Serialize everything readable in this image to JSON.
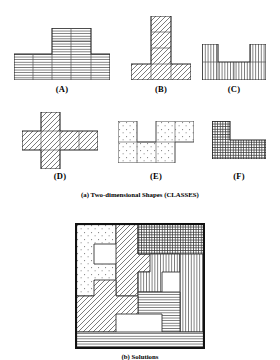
{
  "figure": {
    "panel_a": {
      "caption": "(a) Two-dimensional Shapes (CLASSES)",
      "shapes": [
        {
          "label": "(A)",
          "name": "shape-a",
          "fill": "horizontal-lines",
          "cells": [
            [
              0,
              1
            ],
            [
              1,
              1
            ],
            [
              2,
              1
            ],
            [
              3,
              1
            ],
            [
              4,
              1
            ],
            [
              3,
              0
            ],
            [
              2,
              0
            ]
          ],
          "grid_w": 5,
          "grid_h": 2,
          "note": "5-wide base row with a 2-cell step up on the left of column 4"
        },
        {
          "label": "(B)",
          "name": "shape-b",
          "fill": "diagonal-hatch",
          "cells": [
            [
              0,
              3
            ],
            [
              1,
              3
            ],
            [
              2,
              3
            ],
            [
              1,
              0
            ],
            [
              1,
              1
            ],
            [
              1,
              2
            ]
          ],
          "grid_w": 3,
          "grid_h": 4,
          "note": "inverted T: 3-wide base with 3-tall centre column"
        },
        {
          "label": "(C)",
          "name": "shape-c",
          "fill": "vertical-lines",
          "cells": [
            [
              0,
              1
            ],
            [
              1,
              1
            ],
            [
              2,
              1
            ],
            [
              3,
              1
            ],
            [
              0,
              0
            ],
            [
              3,
              0
            ]
          ],
          "grid_w": 4,
          "grid_h": 2,
          "note": "U shape: 4-wide base with one cell up at each end"
        },
        {
          "label": "(D)",
          "name": "shape-d",
          "fill": "diagonal-hatch",
          "cells": [
            [
              0,
              1
            ],
            [
              1,
              1
            ],
            [
              2,
              1
            ],
            [
              3,
              1
            ],
            [
              1,
              0
            ],
            [
              1,
              2
            ]
          ],
          "grid_w": 4,
          "grid_h": 3,
          "note": "cross/plus: 4-wide row with cell above and below column 2"
        },
        {
          "label": "(E)",
          "name": "shape-e",
          "fill": "dots",
          "cells": [
            [
              0,
              0
            ],
            [
              2,
              0
            ],
            [
              3,
              0
            ],
            [
              0,
              1
            ],
            [
              1,
              1
            ],
            [
              2,
              1
            ]
          ],
          "grid_w": 4,
          "grid_h": 2,
          "note": "stippled W-like polyomino"
        },
        {
          "label": "(F)",
          "name": "shape-f",
          "fill": "cross-hatch",
          "cells": [
            [
              0,
              0
            ],
            [
              0,
              1
            ],
            [
              1,
              1
            ],
            [
              2,
              1
            ]
          ],
          "grid_w": 3,
          "grid_h": 2,
          "note": "L shape, dense grid fill"
        }
      ]
    },
    "panel_b": {
      "caption": "(b) Solutions",
      "name": "solutions-packing-diagram",
      "pieces": [
        {
          "name": "piece-dots",
          "fill": "dots"
        },
        {
          "name": "piece-diagonal-upper",
          "fill": "diagonal-hatch"
        },
        {
          "name": "piece-crosshatch",
          "fill": "cross-hatch"
        },
        {
          "name": "piece-vertical-upper",
          "fill": "vertical-lines"
        },
        {
          "name": "piece-vertical-right",
          "fill": "vertical-lines"
        },
        {
          "name": "piece-horizontal-mid",
          "fill": "horizontal-lines"
        },
        {
          "name": "piece-diagonal-lower",
          "fill": "diagonal-hatch"
        },
        {
          "name": "piece-horizontal-bottom",
          "fill": "horizontal-lines"
        }
      ]
    }
  },
  "colors": {
    "ink": "#111111",
    "line": "#555555",
    "background": "#ffffff"
  }
}
